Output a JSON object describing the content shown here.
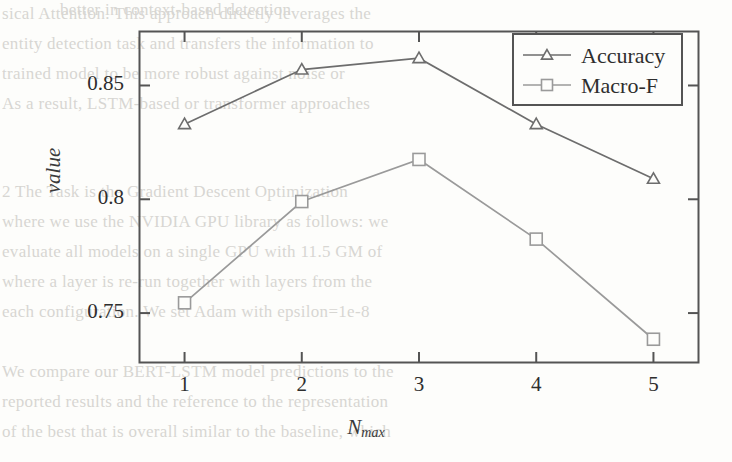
{
  "chart_data": {
    "type": "line",
    "title": "",
    "xlabel": "N_max",
    "xlabel_base": "N",
    "xlabel_sub": "max",
    "ylabel": "value",
    "x": [
      1,
      2,
      3,
      4,
      5
    ],
    "xtick_labels": [
      "1",
      "2",
      "3",
      "4",
      "5"
    ],
    "ytick_labels": [
      "0.75",
      "0.8",
      "0.85"
    ],
    "ytick_values": [
      0.75,
      0.8,
      0.85
    ],
    "xlim": [
      0.62,
      5.38
    ],
    "ylim": [
      0.7285,
      0.8735
    ],
    "grid": false,
    "legend_position": "upper-right",
    "series": [
      {
        "name": "Accuracy",
        "marker": "triangle",
        "color": "#6d6d6d",
        "values": [
          0.833,
          0.857,
          0.862,
          0.833,
          0.809
        ]
      },
      {
        "name": "Macro-F",
        "marker": "square",
        "color": "#9a9a9a",
        "values": [
          0.7545,
          0.799,
          0.8175,
          0.7825,
          0.7385
        ]
      }
    ]
  },
  "legend": {
    "entries": [
      {
        "label": "Accuracy",
        "marker": "triangle-icon"
      },
      {
        "label": "Macro-F",
        "marker": "square-icon"
      }
    ]
  },
  "colors": {
    "accuracy": "#6d6d6d",
    "macro_f": "#9a9a9a",
    "axis": "#545454",
    "text": "#2e2e2e"
  },
  "background_text": {
    "lines": [
      "sical Attention. This approach directly leverages the",
      "entity detection task and transfers the information to",
      "trained model to be more robust against noise or",
      "As a result, LSTM-based or transformer approaches",
      "better in context-based detection",
      "2 The Task is the Gradient Descent Optimization",
      "where we use the NVIDIA GPU library as follows: we",
      "evaluate all models on a single GPU with 11.5 GM of",
      "where a layer is re-run together with layers from the",
      "each configuration. We set Adam with epsilon=1e-8",
      "We compare our BERT-LSTM model predictions to the",
      "reported results and the reference to the representation",
      "of the best that is overall similar to the baseline, which"
    ]
  }
}
